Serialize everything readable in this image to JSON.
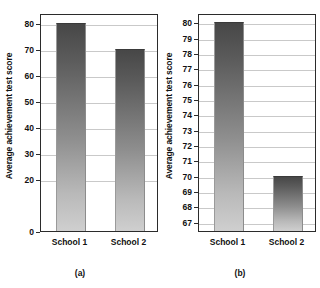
{
  "figure": {
    "background": "#ffffff",
    "bar_color_top": "#474747",
    "bar_color_bottom": "#cfcfcf",
    "frame_color": "#2b2b2b",
    "grid_color": "#c9c9c9"
  },
  "chart_data": [
    {
      "type": "bar",
      "panel": "(a)",
      "title": "",
      "xlabel": "",
      "ylabel": "Average achievement test score",
      "categories": [
        "School 1",
        "School 2"
      ],
      "values": [
        80,
        70
      ],
      "yticks": [
        0,
        20,
        30,
        40,
        50,
        60,
        70,
        80
      ],
      "ylim": [
        0,
        84
      ],
      "grid": true,
      "legend": "none"
    },
    {
      "type": "bar",
      "panel": "(b)",
      "title": "",
      "xlabel": "",
      "ylabel": "Average achievement test score",
      "categories": [
        "School 1",
        "School 2"
      ],
      "values": [
        80,
        70
      ],
      "yticks": [
        67,
        68,
        69,
        70,
        71,
        72,
        73,
        74,
        75,
        76,
        77,
        78,
        79,
        80
      ],
      "ylim": [
        66.4,
        80.6
      ],
      "grid": true,
      "legend": "none"
    }
  ],
  "panel_a": {
    "caption": "(a)",
    "ylabel": "Average achievement test score",
    "ticks": [
      "80",
      "70",
      "60",
      "50",
      "40",
      "30",
      "20",
      "0"
    ],
    "categories": [
      "School 1",
      "School 2"
    ]
  },
  "panel_b": {
    "caption": "(b)",
    "ylabel": "Average achievement test score",
    "ticks": [
      "80",
      "79",
      "78",
      "77",
      "76",
      "75",
      "74",
      "73",
      "72",
      "71",
      "70",
      "69",
      "68",
      "67"
    ],
    "categories": [
      "School 1",
      "School 2"
    ]
  }
}
